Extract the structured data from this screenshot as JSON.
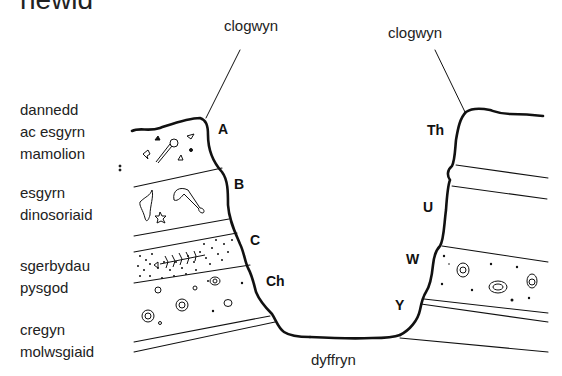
{
  "title": "newid",
  "top_labels": {
    "left_cliff": "clogwyn",
    "right_cliff": "clogwyn"
  },
  "bottom_label": "dyffryn",
  "layer_labels": [
    {
      "line1": "dannedd",
      "line2": "ac esgyrn",
      "line3": "mamolion"
    },
    {
      "line1": "esgyrn",
      "line2": "dinosoriaid"
    },
    {
      "line1": "sgerbydau",
      "line2": "pysgod"
    },
    {
      "line1": "cregyn",
      "line2": "molwsgiaid"
    }
  ],
  "left_points": [
    "A",
    "B",
    "C",
    "Ch"
  ],
  "right_points": [
    "Th",
    "U",
    "W",
    "Y"
  ],
  "colors": {
    "line": "#111111",
    "text": "#222222",
    "background": "#ffffff"
  }
}
